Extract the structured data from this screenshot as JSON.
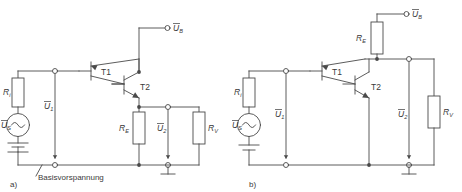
{
  "figure": {
    "type": "electronic-schematic",
    "line_color": "#4a4a4a",
    "text_color": "#3a3a3a",
    "background": "#ffffff"
  },
  "circuits": [
    {
      "id": "a",
      "caption": "a)",
      "note": "Basisvorspannung",
      "supply_label": "U",
      "supply_sub": "B",
      "source_label": "U",
      "source_sub": "S",
      "input_label": "U",
      "input_sub": "1",
      "output_label": "U",
      "output_sub": "2",
      "resistors": [
        {
          "name": "R",
          "sub": "i",
          "role": "source-resistance"
        },
        {
          "name": "R",
          "sub": "E",
          "role": "emitter-resistor"
        },
        {
          "name": "R",
          "sub": "V",
          "role": "load-resistor"
        }
      ],
      "transistors": [
        {
          "label": "T1",
          "role": "driver"
        },
        {
          "label": "T2",
          "role": "output"
        }
      ]
    },
    {
      "id": "b",
      "caption": "b)",
      "note": "",
      "supply_label": "U",
      "supply_sub": "B",
      "source_label": "U",
      "source_sub": "S",
      "input_label": "U",
      "input_sub": "1",
      "output_label": "U",
      "output_sub": "2",
      "resistors": [
        {
          "name": "R",
          "sub": "i",
          "role": "source-resistance"
        },
        {
          "name": "R",
          "sub": "E",
          "role": "collector-resistor"
        },
        {
          "name": "R",
          "sub": "V",
          "role": "load-resistor"
        }
      ],
      "transistors": [
        {
          "label": "T1",
          "role": "driver"
        },
        {
          "label": "T2",
          "role": "output"
        }
      ]
    }
  ]
}
